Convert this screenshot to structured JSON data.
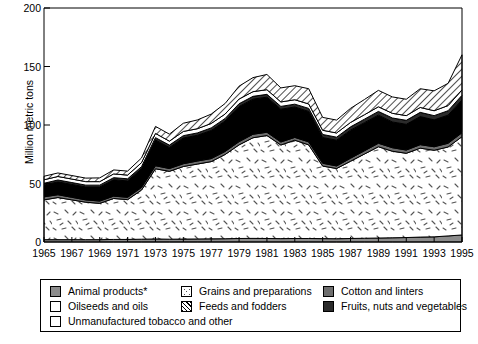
{
  "chart_data": {
    "type": "area",
    "stacked": true,
    "title": "",
    "xlabel": "",
    "ylabel": "Million metric tons",
    "ylim": [
      0,
      200
    ],
    "yticks": [
      0,
      50,
      100,
      150,
      200
    ],
    "xlim": [
      1965,
      1995
    ],
    "xticks": [
      1965,
      1967,
      1969,
      1971,
      1973,
      1975,
      1977,
      1979,
      1981,
      1983,
      1985,
      1987,
      1989,
      1991,
      1993,
      1995
    ],
    "x": [
      1965,
      1966,
      1967,
      1968,
      1969,
      1970,
      1971,
      1972,
      1973,
      1974,
      1975,
      1976,
      1977,
      1978,
      1979,
      1980,
      1981,
      1982,
      1983,
      1984,
      1985,
      1986,
      1987,
      1988,
      1989,
      1990,
      1991,
      1992,
      1993,
      1994,
      1995
    ],
    "grid": false,
    "legend_position": "bottom",
    "series": [
      {
        "name": "Animal products*",
        "key": "animal",
        "pattern": "solid-gray",
        "color": "#8c8c8c",
        "values": [
          2.0,
          2.0,
          2.0,
          2.0,
          2.0,
          2.2,
          2.2,
          2.4,
          2.6,
          2.4,
          2.5,
          2.6,
          2.7,
          2.8,
          3.0,
          3.1,
          3.0,
          2.9,
          3.0,
          3.0,
          2.9,
          2.8,
          3.0,
          3.2,
          3.4,
          3.6,
          3.8,
          4.2,
          4.4,
          5.2,
          6.0
        ]
      },
      {
        "name": "Grains and preparations",
        "key": "grains",
        "pattern": "speckle",
        "color": "#ffffff",
        "values": [
          34.0,
          36.0,
          34.0,
          32.0,
          31.0,
          35.0,
          34.0,
          42.0,
          60.0,
          58.0,
          62.0,
          64.0,
          66.0,
          72.0,
          80.0,
          86.0,
          88.0,
          80.0,
          84.0,
          80.0,
          62.0,
          60.0,
          66.0,
          72.0,
          78.0,
          74.0,
          72.0,
          76.0,
          74.0,
          76.0,
          84.0
        ]
      },
      {
        "name": "Cotton and linters",
        "key": "cotton",
        "pattern": "solid-gray-dark",
        "color": "#6e6e6e",
        "values": [
          2.6,
          2.4,
          2.2,
          2.0,
          2.0,
          2.0,
          2.0,
          2.2,
          2.6,
          2.4,
          2.4,
          2.6,
          2.6,
          2.6,
          2.8,
          3.0,
          2.8,
          2.6,
          2.4,
          2.6,
          2.4,
          2.2,
          2.6,
          2.8,
          3.0,
          3.0,
          2.8,
          3.0,
          3.0,
          3.2,
          3.4
        ]
      },
      {
        "name": "Oilseeds and oils",
        "key": "oilseeds",
        "pattern": "solid-black",
        "color": "#000000",
        "values": [
          10.0,
          11.0,
          11.0,
          11.0,
          12.0,
          14.0,
          14.0,
          16.0,
          22.0,
          18.0,
          22.0,
          22.0,
          24.0,
          26.0,
          30.0,
          30.0,
          30.0,
          28.0,
          26.0,
          26.0,
          22.0,
          22.0,
          24.0,
          24.0,
          24.0,
          22.0,
          22.0,
          24.0,
          23.0,
          24.0,
          28.0
        ]
      },
      {
        "name": "Fruits, nuts and vegetables",
        "key": "fruits",
        "pattern": "solid-near-black",
        "color": "#2b2b2b",
        "values": [
          1.6,
          1.6,
          1.6,
          1.6,
          1.6,
          1.8,
          1.8,
          1.8,
          2.0,
          2.0,
          2.0,
          2.0,
          2.2,
          2.2,
          2.4,
          2.4,
          2.4,
          2.4,
          2.4,
          2.6,
          2.6,
          2.6,
          2.8,
          3.0,
          3.2,
          3.4,
          3.4,
          3.6,
          3.6,
          3.8,
          4.0
        ]
      },
      {
        "name": "Unmanufactured tobacco and other",
        "key": "tobacco",
        "pattern": "solid-white",
        "color": "#ffffff",
        "values": [
          3.0,
          3.0,
          3.0,
          3.0,
          3.0,
          3.2,
          3.2,
          3.4,
          3.6,
          3.4,
          3.6,
          3.6,
          3.8,
          3.8,
          4.0,
          4.0,
          4.0,
          3.8,
          3.8,
          3.8,
          3.6,
          3.6,
          3.8,
          3.8,
          4.0,
          4.0,
          4.0,
          4.2,
          4.2,
          4.4,
          4.6
        ]
      },
      {
        "name": "Feeds and fodders",
        "key": "feeds",
        "pattern": "diagonal-hatch",
        "color": "#ffffff",
        "values": [
          3.0,
          3.0,
          3.0,
          3.0,
          3.2,
          3.4,
          3.4,
          4.0,
          6.0,
          6.0,
          7.0,
          7.5,
          8.0,
          9.0,
          11.0,
          12.0,
          13.0,
          12.0,
          12.0,
          13.0,
          11.0,
          11.0,
          12.0,
          13.0,
          14.0,
          14.0,
          14.0,
          16.0,
          17.0,
          19.0,
          30.0
        ]
      }
    ]
  },
  "axis": {
    "ylabel": "Million metric tons",
    "yticks": [
      "0",
      "50",
      "100",
      "150",
      "200"
    ],
    "xticks": [
      "1965",
      "1967",
      "1969",
      "1971",
      "1973",
      "1975",
      "1977",
      "1979",
      "1981",
      "1983",
      "1985",
      "1987",
      "1989",
      "1991",
      "1993",
      "1995"
    ]
  },
  "legend": {
    "items": [
      {
        "label": "Animal products*",
        "key": "animal"
      },
      {
        "label": "Grains and preparations",
        "key": "grains"
      },
      {
        "label": "Cotton and linters",
        "key": "cotton"
      },
      {
        "label": "Oilseeds and oils",
        "key": "oilseeds"
      },
      {
        "label": "Feeds and fodders",
        "key": "feeds"
      },
      {
        "label": "Fruits, nuts and vegetables",
        "key": "fruits"
      },
      {
        "label": "Unmanufactured tobacco and other",
        "key": "tobacco"
      }
    ]
  },
  "footnote": {
    "text": ""
  }
}
